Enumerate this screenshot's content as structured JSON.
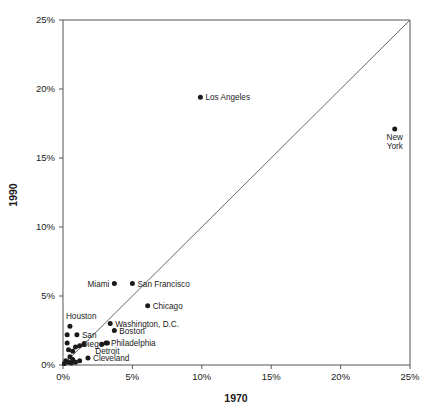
{
  "chart_data": {
    "type": "scatter",
    "title": "",
    "xlabel": "1970",
    "ylabel": "1990",
    "xlim": [
      0,
      25
    ],
    "ylim": [
      0,
      25
    ],
    "xticks": [
      "0%",
      "5%",
      "10%",
      "15%",
      "20%",
      "25%"
    ],
    "xtick_values": [
      0,
      5,
      10,
      15,
      20,
      25
    ],
    "yticks": [
      "0%",
      "5%",
      "10%",
      "15%",
      "20%",
      "25%"
    ],
    "ytick_values": [
      0,
      5,
      10,
      15,
      20,
      25
    ],
    "grid": false,
    "legend": null,
    "reference_line": {
      "name": "identity-line",
      "from": [
        0,
        0
      ],
      "to": [
        25,
        25
      ]
    },
    "unit": "percent",
    "points": [
      {
        "label": "New York",
        "x": 23.9,
        "y": 17.1,
        "label_pos": "below"
      },
      {
        "label": "Los Angeles",
        "x": 9.9,
        "y": 19.4,
        "label_pos": "right"
      },
      {
        "label": "San Francisco",
        "x": 5.0,
        "y": 5.9,
        "label_pos": "right"
      },
      {
        "label": "Miami",
        "x": 3.7,
        "y": 5.9,
        "label_pos": "left"
      },
      {
        "label": "Chicago",
        "x": 6.1,
        "y": 4.3,
        "label_pos": "right"
      },
      {
        "label": "Washington, D.C.",
        "x": 3.4,
        "y": 3.0,
        "label_pos": "right"
      },
      {
        "label": "Boston",
        "x": 3.7,
        "y": 2.5,
        "label_pos": "right"
      },
      {
        "label": "Houston",
        "x": 0.5,
        "y": 2.8,
        "label_pos": "above"
      },
      {
        "label": "Philadelphia",
        "x": 3.1,
        "y": 1.6,
        "label_pos": "right"
      },
      {
        "label": "Detroit",
        "x": 3.2,
        "y": 1.6,
        "label_pos": "below"
      },
      {
        "label": "San Diego",
        "x": 1.0,
        "y": 2.2,
        "label_pos": "right"
      },
      {
        "label": "Cleveland",
        "x": 1.8,
        "y": 0.5,
        "label_pos": "right"
      },
      {
        "label": "",
        "x": 0.3,
        "y": 2.2,
        "label_pos": "none"
      },
      {
        "label": "",
        "x": 0.3,
        "y": 1.6,
        "label_pos": "none"
      },
      {
        "label": "",
        "x": 0.4,
        "y": 1.1,
        "label_pos": "none"
      },
      {
        "label": "",
        "x": 0.7,
        "y": 1.0,
        "label_pos": "none"
      },
      {
        "label": "",
        "x": 0.9,
        "y": 1.3,
        "label_pos": "none"
      },
      {
        "label": "",
        "x": 1.2,
        "y": 1.4,
        "label_pos": "none"
      },
      {
        "label": "",
        "x": 1.5,
        "y": 1.5,
        "label_pos": "none"
      },
      {
        "label": "",
        "x": 0.5,
        "y": 0.6,
        "label_pos": "none"
      },
      {
        "label": "",
        "x": 0.7,
        "y": 0.4,
        "label_pos": "none"
      },
      {
        "label": "",
        "x": 0.2,
        "y": 0.3,
        "label_pos": "none"
      },
      {
        "label": "",
        "x": 0.4,
        "y": 0.2,
        "label_pos": "none"
      },
      {
        "label": "",
        "x": 0.9,
        "y": 0.2,
        "label_pos": "none"
      },
      {
        "label": "",
        "x": 1.2,
        "y": 0.3,
        "label_pos": "none"
      },
      {
        "label": "",
        "x": 0.1,
        "y": 0.1,
        "label_pos": "none"
      },
      {
        "label": "",
        "x": 0.6,
        "y": 0.15,
        "label_pos": "none"
      },
      {
        "label": "",
        "x": 2.8,
        "y": 1.5,
        "label_pos": "none"
      }
    ]
  },
  "colors": {
    "point": "#1a1a1a",
    "axis": "#555555",
    "background": "#ffffff",
    "text": "#1a1a1a"
  }
}
